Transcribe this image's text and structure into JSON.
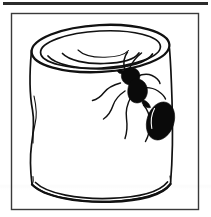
{
  "image": {
    "title": "Ant crawling on a tin can",
    "kind": "line-drawing",
    "background_color": "#ffffff",
    "ink_color": "#111111",
    "frame_color": "#3a3a3a",
    "top_rule_color": "#2b2b2b",
    "width": 211,
    "height": 217
  },
  "frame": {
    "label": "Picture frame border",
    "x": 11,
    "y": 13,
    "width": 188,
    "height": 197
  },
  "top_rule": {
    "label": "Header rule",
    "x": 3,
    "y": 2,
    "width": 205,
    "height": 3
  },
  "subjects": {
    "can": {
      "label": "Tin can",
      "description": "Dented cylindrical tin can seen slightly from above, open lid rim visible, vertical crease on the left side, double-line seam at the bottom.",
      "lid_label": "Can lid",
      "body_label": "Can body",
      "base_label": "Can base seam",
      "crease_label": "Dent crease"
    },
    "ant": {
      "label": "Ant",
      "description": "Large black ant climbing up the right side of the can, head up-left, six jointed legs, bulbous abdomen pointing down-right.",
      "head_label": "Ant head",
      "thorax_label": "Ant thorax",
      "abdomen_label": "Ant abdomen",
      "antenna_label": "Ant antenna",
      "leg_label": "Ant leg",
      "body_color": "#0a0a0a",
      "leg_count": 6,
      "antenna_count": 2
    }
  }
}
